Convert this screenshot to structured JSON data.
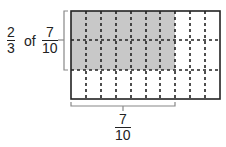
{
  "left_label": {
    "fraction_a": {
      "numerator": "2",
      "denominator": "3"
    },
    "of_text": "of",
    "fraction_b": {
      "numerator": "7",
      "denominator": "10"
    }
  },
  "bottom_label": {
    "numerator": "7",
    "denominator": "10"
  },
  "grid": {
    "columns": 10,
    "rows": 3,
    "shaded_columns": 7,
    "shaded_rows": 2
  },
  "colors": {
    "shade": "#c8c8c8",
    "line": "#222222",
    "bracket": "#888888"
  }
}
